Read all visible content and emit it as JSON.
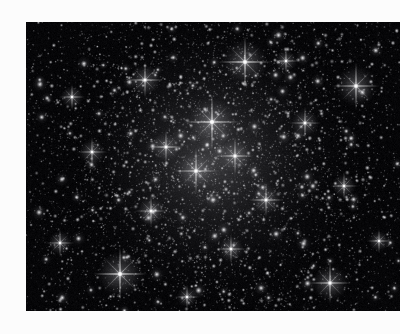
{
  "page": {
    "background_color": "#fcfcfc",
    "width": 400,
    "height": 334
  },
  "photograph": {
    "subject": "globular star cluster",
    "palette": "monochrome grayscale",
    "sky_color": "#060608",
    "star_color": "#ffffff",
    "halo_color": "#c8c8cc",
    "frame": {
      "x": 26,
      "y": 22,
      "width": 374,
      "height": 289
    },
    "cluster_core": {
      "cx": 213,
      "cy": 160,
      "radius": 78,
      "glow_opacity": 0.3
    },
    "field_density": {
      "faint_star_count": 5200,
      "mid_star_count": 760,
      "bright_star_count": 96
    },
    "bright_stars": [
      {
        "x": 245,
        "y": 62,
        "r": 3.2,
        "spike": 26,
        "name": "bright-star-upper-center"
      },
      {
        "x": 212,
        "y": 122,
        "r": 3.4,
        "spike": 28,
        "name": "bright-star-core-upper"
      },
      {
        "x": 120,
        "y": 274,
        "r": 3.3,
        "spike": 27,
        "name": "bright-star-lower-left"
      },
      {
        "x": 356,
        "y": 86,
        "r": 3.0,
        "spike": 24,
        "name": "bright-star-upper-right"
      },
      {
        "x": 330,
        "y": 283,
        "r": 2.8,
        "spike": 21,
        "name": "bright-star-lower-right"
      },
      {
        "x": 145,
        "y": 80,
        "r": 2.6,
        "spike": 18,
        "name": "bright-star-upper-left"
      },
      {
        "x": 196,
        "y": 171,
        "r": 3.0,
        "spike": 23,
        "name": "bright-star-core-center"
      },
      {
        "x": 235,
        "y": 156,
        "r": 2.7,
        "spike": 19,
        "name": "bright-star-core-right"
      },
      {
        "x": 166,
        "y": 147,
        "r": 2.5,
        "spike": 17,
        "name": "bright-star-core-left"
      },
      {
        "x": 266,
        "y": 200,
        "r": 2.5,
        "spike": 17,
        "name": "bright-star-mid-right"
      },
      {
        "x": 151,
        "y": 211,
        "r": 2.4,
        "spike": 16,
        "name": "bright-star-mid-left"
      },
      {
        "x": 305,
        "y": 123,
        "r": 2.4,
        "spike": 16,
        "name": "bright-star-right-upper"
      },
      {
        "x": 92,
        "y": 152,
        "r": 2.3,
        "spike": 15,
        "name": "bright-star-left-mid"
      },
      {
        "x": 231,
        "y": 249,
        "r": 2.3,
        "spike": 15,
        "name": "bright-star-lower-center"
      },
      {
        "x": 344,
        "y": 186,
        "r": 2.2,
        "spike": 14,
        "name": "bright-star-right-mid"
      },
      {
        "x": 60,
        "y": 243,
        "r": 2.2,
        "spike": 14,
        "name": "bright-star-left-lower"
      },
      {
        "x": 286,
        "y": 61,
        "r": 2.1,
        "spike": 13,
        "name": "bright-star-top-right"
      },
      {
        "x": 72,
        "y": 97,
        "r": 2.1,
        "spike": 13,
        "name": "bright-star-top-left"
      },
      {
        "x": 187,
        "y": 297,
        "r": 2.0,
        "spike": 12,
        "name": "bright-star-bottom-center"
      },
      {
        "x": 379,
        "y": 241,
        "r": 2.0,
        "spike": 12,
        "name": "bright-star-right-lower"
      }
    ],
    "seed": 20240517
  }
}
